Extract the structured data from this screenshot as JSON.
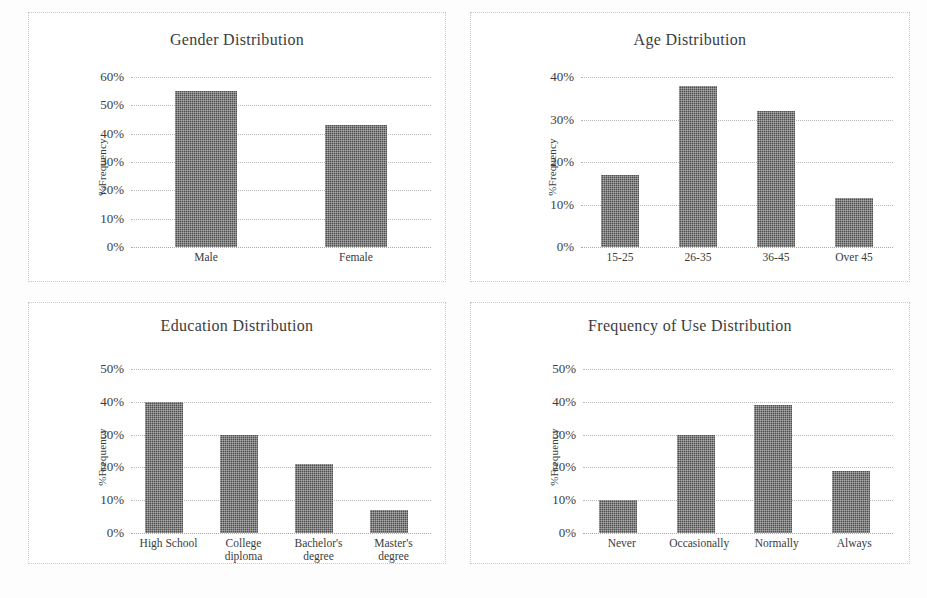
{
  "page": {
    "background": "#ffffff",
    "bar_color": "#4e4e4e",
    "gridline_color": "#b9b9b9",
    "text_color": "#3c3c3c",
    "panel_border_color": "#c9c9c9"
  },
  "charts": [
    {
      "id": "gender",
      "title": "Gender Distribution",
      "ylabel": "%Frequency",
      "yticks": [
        "60%",
        "50%",
        "40%",
        "30%",
        "20%",
        "10%",
        "0%"
      ],
      "categories": [
        "Male",
        "Female"
      ],
      "values": [
        55,
        43
      ]
    },
    {
      "id": "age",
      "title": "Age Distribution",
      "ylabel": "%Frequency",
      "yticks": [
        "40%",
        "30%",
        "20%",
        "10%",
        "0%"
      ],
      "categories": [
        "15-25",
        "26-35",
        "36-45",
        "Over 45"
      ],
      "values": [
        17,
        38,
        32,
        11.5
      ]
    },
    {
      "id": "education",
      "title": "Education Distribution",
      "ylabel": "%Frequency",
      "yticks": [
        "50%",
        "40%",
        "30%",
        "20%",
        "10%",
        "0%"
      ],
      "categories": [
        "High School",
        "College\ndiploma",
        "Bachelor's\ndegree",
        "Master's\ndegree"
      ],
      "values": [
        40,
        30,
        21,
        7
      ]
    },
    {
      "id": "frequency",
      "title": "Frequency of Use Distribution",
      "ylabel": "%Frequency",
      "yticks": [
        "50%",
        "40%",
        "30%",
        "20%",
        "10%",
        "0%"
      ],
      "categories": [
        "Never",
        "Occasionally",
        "Normally",
        "Always"
      ],
      "values": [
        10,
        30,
        39,
        19
      ]
    }
  ],
  "chart_data": [
    {
      "type": "bar",
      "title": "Gender Distribution",
      "xlabel": "",
      "ylabel": "%Frequency",
      "categories": [
        "Male",
        "Female"
      ],
      "values": [
        55,
        43
      ],
      "ylim": [
        0,
        60
      ],
      "ytick_values": [
        0,
        10,
        20,
        30,
        40,
        50,
        60
      ],
      "ytick_labels": [
        "0%",
        "10%",
        "20%",
        "30%",
        "40%",
        "50%",
        "60%"
      ],
      "grid": true,
      "legend": "none"
    },
    {
      "type": "bar",
      "title": "Age Distribution",
      "xlabel": "",
      "ylabel": "%Frequency",
      "categories": [
        "15-25",
        "26-35",
        "36-45",
        "Over 45"
      ],
      "values": [
        17,
        38,
        32,
        11.5
      ],
      "ylim": [
        0,
        40
      ],
      "ytick_values": [
        0,
        10,
        20,
        30,
        40
      ],
      "ytick_labels": [
        "0%",
        "10%",
        "20%",
        "30%",
        "40%"
      ],
      "grid": true,
      "legend": "none"
    },
    {
      "type": "bar",
      "title": "Education Distribution",
      "xlabel": "",
      "ylabel": "%Frequency",
      "categories": [
        "High School",
        "College diploma",
        "Bachelor's degree",
        "Master's degree"
      ],
      "values": [
        40,
        30,
        21,
        7
      ],
      "ylim": [
        0,
        50
      ],
      "ytick_values": [
        0,
        10,
        20,
        30,
        40,
        50
      ],
      "ytick_labels": [
        "0%",
        "10%",
        "20%",
        "30%",
        "40%",
        "50%"
      ],
      "grid": true,
      "legend": "none"
    },
    {
      "type": "bar",
      "title": "Frequency of Use Distribution",
      "xlabel": "",
      "ylabel": "%Frequency",
      "categories": [
        "Never",
        "Occasionally",
        "Normally",
        "Always"
      ],
      "values": [
        10,
        30,
        39,
        19
      ],
      "ylim": [
        0,
        50
      ],
      "ytick_values": [
        0,
        10,
        20,
        30,
        40,
        50
      ],
      "ytick_labels": [
        "0%",
        "10%",
        "20%",
        "30%",
        "40%",
        "50%"
      ],
      "grid": true,
      "legend": "none"
    }
  ]
}
